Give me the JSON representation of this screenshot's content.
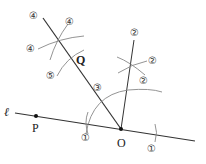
{
  "diagram": {
    "type": "geometric-construction",
    "colors": {
      "line": "#333333",
      "arc": "#777777",
      "text": "#222222",
      "circle": "#555555"
    },
    "points": {
      "P": {
        "label": "P",
        "x": 36,
        "y": 116
      },
      "O": {
        "label": "O",
        "x": 121,
        "y": 129
      },
      "Q": {
        "label": "Q",
        "x": 78,
        "y": 62
      }
    },
    "line_label": "ℓ",
    "step_labels": [
      {
        "text": "④",
        "x": 34,
        "y": 15
      },
      {
        "text": "④",
        "x": 70,
        "y": 21
      },
      {
        "text": "④",
        "x": 31,
        "y": 48
      },
      {
        "text": "⑤",
        "x": 51,
        "y": 75
      },
      {
        "text": "③",
        "x": 98,
        "y": 87
      },
      {
        "text": "②",
        "x": 135,
        "y": 32
      },
      {
        "text": "②",
        "x": 153,
        "y": 60
      },
      {
        "text": "②",
        "x": 144,
        "y": 80
      },
      {
        "text": "①",
        "x": 86,
        "y": 137
      },
      {
        "text": "①",
        "x": 152,
        "y": 148
      }
    ]
  }
}
